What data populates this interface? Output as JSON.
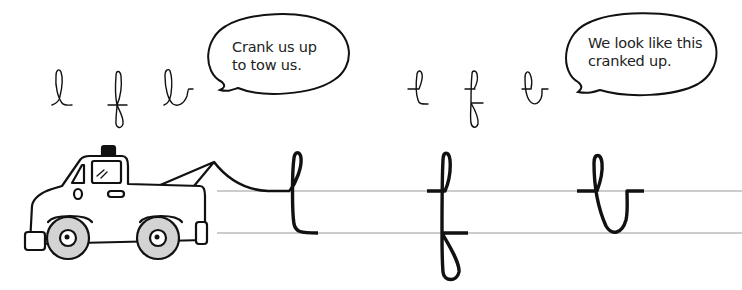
{
  "worksheet": {
    "topic": "Cursive letters l, f, b",
    "colors": {
      "ink": "#111111",
      "guide_line": "#9a9a9a",
      "wheel": "#d3d3d3",
      "background": "#ffffff"
    }
  },
  "left_group": {
    "letters": [
      "l",
      "f",
      "b"
    ],
    "style": "normal cursive loops",
    "speech_bubble": {
      "line1": "Crank us up",
      "line2": "to tow us."
    }
  },
  "right_group": {
    "letters": [
      "l",
      "f",
      "b"
    ],
    "style": "cranked-up cursive loops",
    "speech_bubble": {
      "line1": "We look like this",
      "line2": "cranked up."
    }
  },
  "illustration": {
    "subject": "tow truck",
    "icon": "tow-truck-icon",
    "towing": "tow cable attached to large cursive l"
  },
  "practice_row": {
    "letters": [
      "l",
      "f",
      "b"
    ],
    "guide_lines": 2
  }
}
